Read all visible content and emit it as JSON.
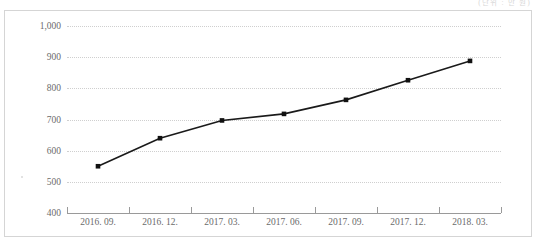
{
  "header": {
    "note": "(단위 : 만 원)"
  },
  "chart_data": {
    "type": "line",
    "title": "",
    "subtitle": "",
    "xlabel": "",
    "ylabel": "",
    "categories": [
      "2016. 09.",
      "2016. 12.",
      "2017. 03.",
      "2017. 06.",
      "2017. 09.",
      "2017. 12.",
      "2018. 03."
    ],
    "values": [
      550,
      640,
      697,
      718,
      763,
      826,
      888
    ],
    "series": [
      {
        "name": "",
        "values": [
          550,
          640,
          697,
          718,
          763,
          826,
          888
        ]
      }
    ],
    "ylim": [
      400,
      1000
    ],
    "ytick_labels": [
      "1,000",
      "900",
      "800",
      "700",
      "600",
      "500",
      "400"
    ],
    "ytick_values": [
      1000,
      900,
      800,
      700,
      600,
      500,
      400
    ],
    "grid": true,
    "grid_style": "dotted",
    "legend": "none",
    "marker": "square",
    "colors": {
      "line": "#1a1a1a",
      "marker": "#111111",
      "grid": "#cfcfcf",
      "axis": "#9a9a9a",
      "tick_text": "#6b6b6b",
      "frame": "#d5d5d5",
      "background": "#ffffff"
    }
  }
}
